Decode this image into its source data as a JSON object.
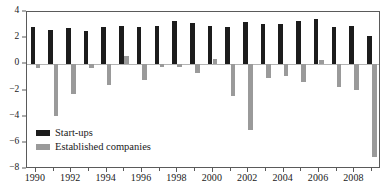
{
  "chart_data": {
    "type": "bar",
    "title": "",
    "subtitle": "",
    "xlabel": "",
    "ylabel": "",
    "grid": false,
    "legend_position": "inside-lower-left",
    "ylim": [
      -8,
      4
    ],
    "ytick_values": [
      4,
      2,
      0,
      -2,
      -4,
      -6,
      -8
    ],
    "ytick_labels": [
      "4",
      "2",
      "0",
      "−2",
      "−4",
      "−6",
      "−8"
    ],
    "xtick_labels": [
      "1990",
      "1992",
      "1994",
      "1996",
      "1998",
      "2000",
      "2002",
      "2004",
      "2006",
      "2008"
    ],
    "categories": [
      "1990",
      "1991",
      "1992",
      "1993",
      "1994",
      "1995",
      "1996",
      "1997",
      "1998",
      "1999",
      "2000",
      "2001",
      "2002",
      "2003",
      "2004",
      "2005",
      "2006",
      "2007",
      "2008",
      "2009"
    ],
    "series": [
      {
        "name": "Start-ups",
        "color": "#1c1c1c",
        "values": [
          2.85,
          2.6,
          2.75,
          2.55,
          2.85,
          2.9,
          2.85,
          2.95,
          3.3,
          3.15,
          2.95,
          2.85,
          3.25,
          3.05,
          3.05,
          3.3,
          3.45,
          2.85,
          2.9,
          2.2
        ]
      },
      {
        "name": "Established companies",
        "color": "#9a9a9a",
        "values": [
          -0.3,
          -3.95,
          -2.3,
          -0.25,
          -1.6,
          0.6,
          -1.2,
          -0.2,
          -0.2,
          -0.7,
          0.4,
          -2.4,
          -5.0,
          -1.05,
          -0.9,
          -1.35,
          0.3,
          -1.75,
          -1.95,
          -7.05
        ]
      }
    ],
    "colors": {
      "startups": "#1c1c1c",
      "established": "#9a9a9a",
      "axis": "#5a5a5a",
      "zero_line": "#b4b4b4",
      "background": "#ffffff"
    }
  },
  "legend": {
    "items": [
      {
        "label": "Start-ups"
      },
      {
        "label": "Established companies"
      }
    ]
  }
}
